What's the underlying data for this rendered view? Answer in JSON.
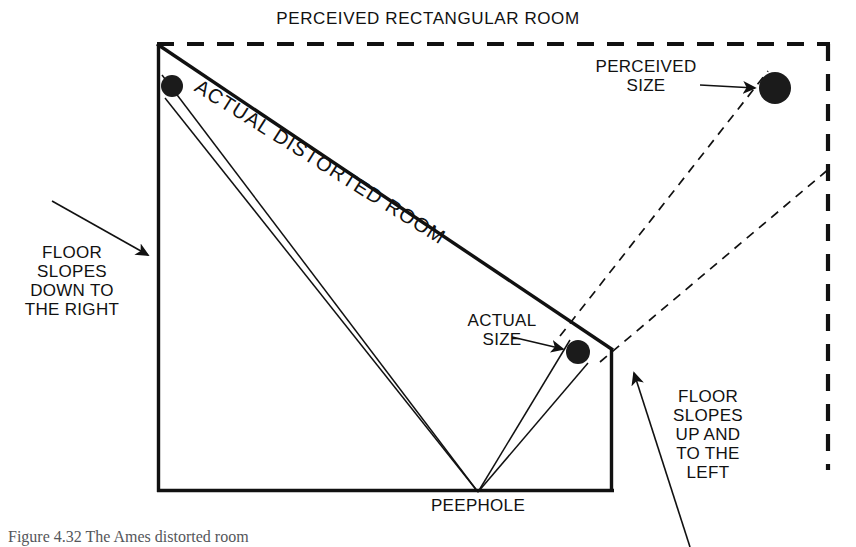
{
  "figure": {
    "domain": "diagram",
    "background_color": "#ffffff",
    "ink_color": "#111111",
    "caption": "Figure 4.32   The Ames distorted room"
  },
  "labels": {
    "title": "PERCEIVED RECTANGULAR ROOM",
    "perceived_size": "PERCEIVED\nSIZE",
    "actual_size": "ACTUAL\nSIZE",
    "actual_distorted_room": "ACTUAL DISTORTED ROOM",
    "floor_slopes_down": "FLOOR\nSLOPES\nDOWN TO\nTHE RIGHT",
    "floor_slopes_up": "FLOOR\nSLOPES\nUP AND\nTO THE\nLEFT",
    "peephole": "PEEPHOLE"
  },
  "curved_text": {
    "actual_distorted_room_chars": "ACTUAL DISTORTED ROOM"
  },
  "geometry": {
    "perceived_room": {
      "style": "dashed",
      "top_left": [
        157,
        44
      ],
      "top_right": [
        828,
        44
      ],
      "right_bottom": [
        828,
        470
      ],
      "note": "dashed rectangle outline, open at bottom and partially at left"
    },
    "actual_room": {
      "style": "solid",
      "left_wall_top": [
        157,
        44
      ],
      "left_wall_bottom": [
        157,
        492
      ],
      "floor_left": [
        157,
        492
      ],
      "floor_right": [
        613,
        492
      ],
      "right_wall_top": [
        613,
        350
      ],
      "right_wall_bottom": [
        613,
        492
      ],
      "ceiling_from": [
        157,
        44
      ],
      "ceiling_to": [
        613,
        350
      ]
    },
    "peephole_point": [
      478,
      492
    ],
    "spheres": [
      {
        "name": "actual-size-sphere-left",
        "cx": 172,
        "cy": 86,
        "r": 11
      },
      {
        "name": "actual-size-sphere-right",
        "cx": 578,
        "cy": 352,
        "r": 12
      },
      {
        "name": "perceived-size-sphere",
        "cx": 775,
        "cy": 88,
        "r": 16
      }
    ],
    "sight_lines_solid": [
      {
        "from": [
          478,
          492
        ],
        "to": [
          163,
          75
        ]
      },
      {
        "from": [
          478,
          492
        ],
        "to": [
          166,
          97
        ]
      },
      {
        "from": [
          478,
          492
        ],
        "to": [
          572,
          341
        ]
      },
      {
        "from": [
          478,
          492
        ],
        "to": [
          586,
          362
        ]
      }
    ],
    "projection_lines_dashed": [
      {
        "from": [
          478,
          492
        ],
        "to": [
          768,
          73
        ]
      },
      {
        "from": [
          478,
          492
        ],
        "to": [
          830,
          170
        ]
      }
    ],
    "annotation_arrows": [
      {
        "name": "floor-down-arrow",
        "from": [
          52,
          201
        ],
        "to": [
          150,
          256
        ]
      },
      {
        "name": "floor-up-arrow",
        "from": [
          688,
          545
        ],
        "to": [
          634,
          374
        ]
      },
      {
        "name": "actual-size-arrow",
        "from": [
          512,
          338
        ],
        "to": [
          564,
          350
        ]
      },
      {
        "name": "perceived-size-arrow",
        "from": [
          700,
          85
        ],
        "to": [
          756,
          88
        ]
      }
    ]
  }
}
